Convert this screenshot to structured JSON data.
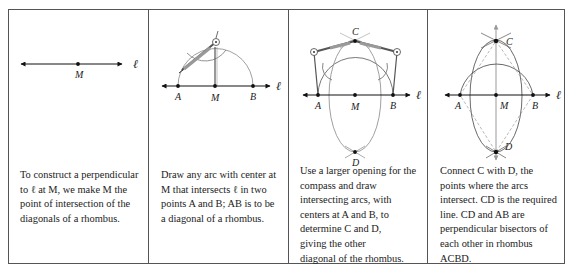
{
  "panels": [
    {
      "id": "step1",
      "labels": {
        "point_m": "M",
        "line": "ℓ"
      },
      "caption": [
        "To construct a perpendicular",
        "to ℓ at M, we make M the",
        "point of intersection of the",
        "diagonals of a rhombus."
      ]
    },
    {
      "id": "step2",
      "labels": {
        "point_a": "A",
        "point_m": "M",
        "point_b": "B",
        "line": "ℓ"
      },
      "caption": [
        "Draw any arc with center at",
        "M that intersects ℓ in two",
        "points A and B; AB is to be",
        "a diagonal of a rhombus."
      ]
    },
    {
      "id": "step3",
      "labels": {
        "point_a": "A",
        "point_m": "M",
        "point_b": "B",
        "point_c": "C",
        "point_d": "D",
        "line": "ℓ"
      },
      "caption": [
        "Use a larger opening for the",
        "compass and draw",
        "intersecting arcs, with",
        "centers at A and B, to",
        "determine C and D,",
        "giving the other",
        "diagonal of the rhombus."
      ]
    },
    {
      "id": "step4",
      "labels": {
        "point_a": "A",
        "point_m": "M",
        "point_b": "B",
        "point_c": "C",
        "point_d": "D",
        "line": "ℓ"
      },
      "caption": [
        "Connect C with D, the",
        "points where the arcs",
        "intersect. CD is the required",
        "line. CD and AB are",
        "perpendicular bisectors of",
        "each other in rhombus",
        "ACBD."
      ]
    }
  ]
}
